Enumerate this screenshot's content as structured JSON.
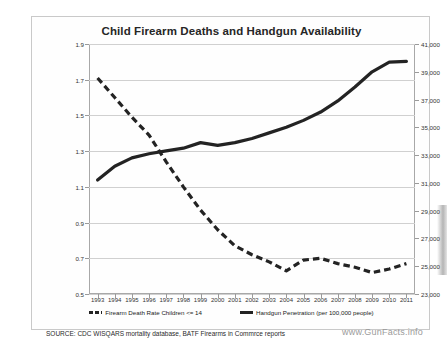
{
  "chart_data": {
    "type": "line",
    "title": "Child Firearm Deaths and Handgun Availability",
    "xlabel": "",
    "ylabel": "",
    "grid": true,
    "legend_position": "bottom",
    "categories": [
      "1993",
      "1994",
      "1995",
      "1996",
      "1997",
      "1998",
      "1999",
      "2000",
      "2001",
      "2002",
      "2003",
      "2004",
      "2005",
      "2006",
      "2007",
      "2008",
      "2009",
      "2010",
      "2011"
    ],
    "axes": {
      "left": {
        "label": "Firearm Death Rate Children <= 14",
        "ylim": [
          0.5,
          1.9
        ],
        "ticks": [
          "0.5",
          "0.7",
          "0.9",
          "1.1",
          "1.3",
          "1.5",
          "1.7",
          "1.9"
        ],
        "tick_values": [
          0.5,
          0.7,
          0.9,
          1.1,
          1.3,
          1.5,
          1.7,
          1.9
        ]
      },
      "right": {
        "label": "Handgun Penetration (per 100,000 people)",
        "ylim": [
          23000,
          41000
        ],
        "ticks": [
          "23,000",
          "25,000",
          "27,000",
          "29,000",
          "31,000",
          "33,000",
          "35,000",
          "37,000",
          "39,000",
          "41,000"
        ],
        "tick_values": [
          23000,
          25000,
          27000,
          29000,
          31000,
          33000,
          35000,
          37000,
          39000,
          41000
        ]
      }
    },
    "series": [
      {
        "name": "Firearm Death Rate Children <= 14",
        "axis": "left",
        "style": "dashed",
        "color": "#232323",
        "values": [
          1.71,
          1.6,
          1.49,
          1.39,
          1.24,
          1.1,
          0.97,
          0.86,
          0.77,
          0.72,
          0.68,
          0.63,
          0.69,
          0.7,
          0.67,
          0.65,
          0.62,
          0.64,
          0.67
        ]
      },
      {
        "name": "Handgun Penetration (per 100,000 people)",
        "axis": "right",
        "style": "solid",
        "color": "#232323",
        "values": [
          31200,
          32200,
          32800,
          33100,
          33300,
          33500,
          33900,
          33700,
          33900,
          34200,
          34600,
          35000,
          35500,
          36100,
          36900,
          37900,
          39000,
          39700,
          39750
        ]
      }
    ]
  },
  "legend": {
    "items": [
      {
        "label": "Firearm Death Rate Children <= 14",
        "marker": "dashed-line-swatch"
      },
      {
        "label": "Handgun Penetration (per 100,000 people)",
        "marker": "solid-line-swatch"
      }
    ]
  },
  "footer": {
    "source": "SOURCE: CDC WISQARS mortality database, BATF Firearms in Commrce reports",
    "watermark": "www.GunFacts.info"
  }
}
